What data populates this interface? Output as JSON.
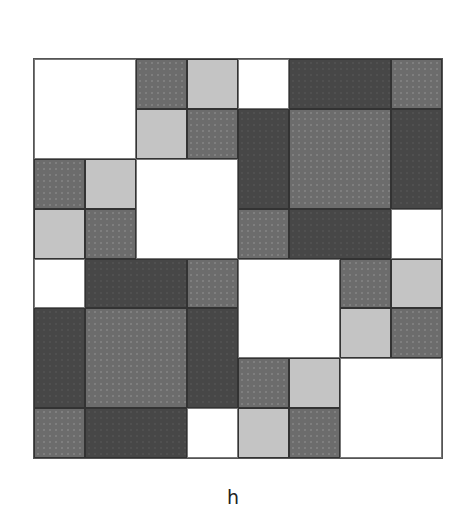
{
  "figure": {
    "label": "h",
    "grid": {
      "rows": 8,
      "cols": 8
    },
    "tones": {
      "W": "#ffffff",
      "L": "#c4c4c4",
      "M": "#6c6c6c",
      "D": "#474747"
    },
    "cells": [
      [
        "W",
        "W",
        "M",
        "L",
        "W",
        "D",
        "D",
        "M"
      ],
      [
        "W",
        "W",
        "L",
        "M",
        "D",
        "M",
        "M",
        "D"
      ],
      [
        "M",
        "L",
        "W",
        "W",
        "D",
        "M",
        "M",
        "D"
      ],
      [
        "L",
        "M",
        "W",
        "W",
        "M",
        "D",
        "D",
        "W"
      ],
      [
        "W",
        "D",
        "D",
        "M",
        "W",
        "W",
        "M",
        "L"
      ],
      [
        "D",
        "M",
        "M",
        "D",
        "W",
        "W",
        "L",
        "M"
      ],
      [
        "D",
        "M",
        "M",
        "D",
        "M",
        "L",
        "W",
        "W"
      ],
      [
        "M",
        "D",
        "D",
        "W",
        "L",
        "M",
        "W",
        "W"
      ]
    ],
    "blocks": [
      [
        0,
        0,
        2,
        2,
        "W"
      ],
      [
        0,
        2,
        1,
        1,
        "M"
      ],
      [
        0,
        3,
        1,
        1,
        "L"
      ],
      [
        0,
        4,
        1,
        1,
        "W"
      ],
      [
        0,
        5,
        1,
        2,
        "D"
      ],
      [
        0,
        7,
        1,
        1,
        "M"
      ],
      [
        1,
        2,
        1,
        1,
        "L"
      ],
      [
        1,
        3,
        1,
        1,
        "M"
      ],
      [
        1,
        4,
        2,
        1,
        "D"
      ],
      [
        1,
        5,
        2,
        2,
        "M"
      ],
      [
        1,
        7,
        2,
        1,
        "D"
      ],
      [
        2,
        0,
        1,
        1,
        "M"
      ],
      [
        2,
        1,
        1,
        1,
        "L"
      ],
      [
        2,
        2,
        2,
        2,
        "W"
      ],
      [
        3,
        0,
        1,
        1,
        "L"
      ],
      [
        3,
        1,
        1,
        1,
        "M"
      ],
      [
        3,
        4,
        1,
        1,
        "M"
      ],
      [
        3,
        5,
        1,
        2,
        "D"
      ],
      [
        3,
        7,
        1,
        1,
        "W"
      ],
      [
        4,
        0,
        1,
        1,
        "W"
      ],
      [
        4,
        1,
        1,
        2,
        "D"
      ],
      [
        4,
        3,
        1,
        1,
        "M"
      ],
      [
        4,
        4,
        2,
        2,
        "W"
      ],
      [
        4,
        6,
        1,
        1,
        "M"
      ],
      [
        4,
        7,
        1,
        1,
        "L"
      ],
      [
        5,
        0,
        2,
        1,
        "D"
      ],
      [
        5,
        1,
        2,
        2,
        "M"
      ],
      [
        5,
        3,
        2,
        1,
        "D"
      ],
      [
        5,
        6,
        1,
        1,
        "L"
      ],
      [
        5,
        7,
        1,
        1,
        "M"
      ],
      [
        6,
        4,
        1,
        1,
        "M"
      ],
      [
        6,
        5,
        1,
        1,
        "L"
      ],
      [
        6,
        6,
        2,
        2,
        "W"
      ],
      [
        7,
        0,
        1,
        1,
        "M"
      ],
      [
        7,
        1,
        1,
        2,
        "D"
      ],
      [
        7,
        3,
        1,
        1,
        "W"
      ],
      [
        7,
        4,
        1,
        1,
        "L"
      ],
      [
        7,
        5,
        1,
        1,
        "M"
      ]
    ]
  }
}
